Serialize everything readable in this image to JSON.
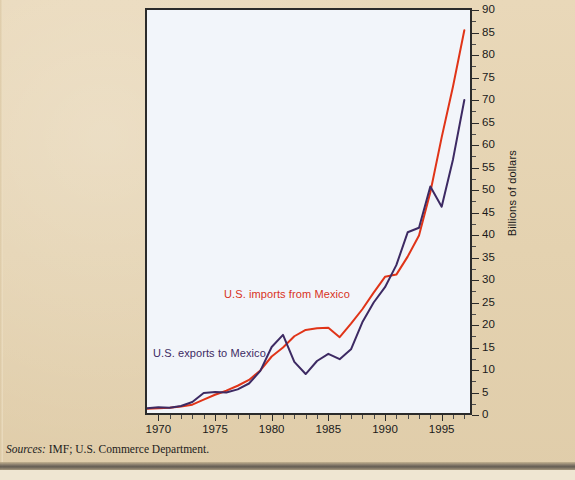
{
  "figure": {
    "background_color": "#e4d2b0",
    "plot_background_color": "#f2f5fa",
    "source_lead": "Sources:",
    "source_text": " IMF; U.S. Commerce Department."
  },
  "chart_data": {
    "type": "line",
    "title": "",
    "xlabel": "",
    "ylabel": "Billions of dollars",
    "xlim": [
      1969,
      1997.5
    ],
    "ylim": [
      0,
      90
    ],
    "grid": false,
    "legend_position": "inline-annotations",
    "y_ticks": [
      0,
      5,
      10,
      15,
      20,
      25,
      30,
      35,
      40,
      45,
      50,
      55,
      60,
      65,
      70,
      75,
      80,
      85,
      90
    ],
    "y_tick_labels": [
      "0",
      "5",
      "10",
      "15",
      "20",
      "25",
      "30",
      "35",
      "40",
      "45",
      "50",
      "55",
      "60",
      "65",
      "70",
      "75",
      "80",
      "85",
      "90"
    ],
    "x_ticks": [
      1970,
      1975,
      1980,
      1985,
      1990,
      1995
    ],
    "x_tick_labels": [
      "1970",
      "1975",
      "1980",
      "1985",
      "1990",
      "1995"
    ],
    "x_minor_tick_step": 1,
    "x": [
      1969,
      1970,
      1971,
      1972,
      1973,
      1974,
      1975,
      1976,
      1977,
      1978,
      1979,
      1980,
      1981,
      1982,
      1983,
      1984,
      1985,
      1986,
      1987,
      1988,
      1989,
      1990,
      1991,
      1992,
      1993,
      1994,
      1995,
      1996,
      1997
    ],
    "series": [
      {
        "name": "U.S. imports from Mexico",
        "color": "#e03418",
        "annotation": "U.S. imports from Mexico",
        "values": [
          1.4,
          1.5,
          1.6,
          1.9,
          2.3,
          3.4,
          4.5,
          5.4,
          6.5,
          7.8,
          9.9,
          13.0,
          15.0,
          17.5,
          18.9,
          19.3,
          19.4,
          17.3,
          20.3,
          23.5,
          27.2,
          30.7,
          31.2,
          35.2,
          39.9,
          49.5,
          61.7,
          73.0,
          85.5
        ]
      },
      {
        "name": "U.S. exports to Mexico",
        "color": "#3d2a63",
        "annotation": "U.S. exports to Mexico",
        "values": [
          1.5,
          1.7,
          1.6,
          2.0,
          2.9,
          4.9,
          5.1,
          5.0,
          5.7,
          7.0,
          9.8,
          15.1,
          17.8,
          11.8,
          9.1,
          12.0,
          13.6,
          12.4,
          14.6,
          20.6,
          25.0,
          28.4,
          33.3,
          40.6,
          41.6,
          50.8,
          46.3,
          56.8,
          70.0
        ]
      }
    ]
  }
}
